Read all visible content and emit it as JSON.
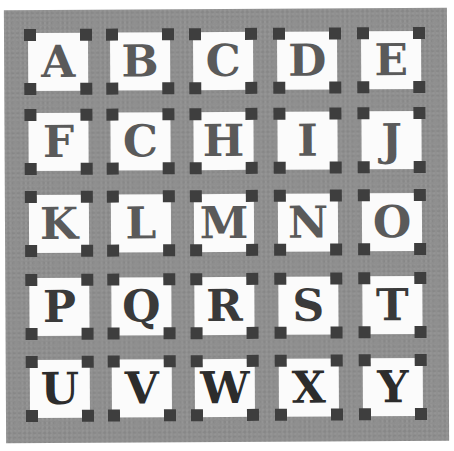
{
  "colors": {
    "sashing": "#8f8f8f",
    "block": "#fbfbfb",
    "corner": "#3e3e3e",
    "letter": "#5a5a5a"
  },
  "rows": [
    {
      "letters": [
        "A",
        "B",
        "C",
        "D",
        "E"
      ]
    },
    {
      "letters": [
        "F",
        "C",
        "H",
        "I",
        "J"
      ]
    },
    {
      "letters": [
        "K",
        "L",
        "M",
        "N",
        "O"
      ]
    },
    {
      "letters": [
        "P",
        "Q",
        "R",
        "S",
        "T"
      ]
    },
    {
      "letters": [
        "U",
        "V",
        "W",
        "X",
        "Y"
      ]
    }
  ]
}
